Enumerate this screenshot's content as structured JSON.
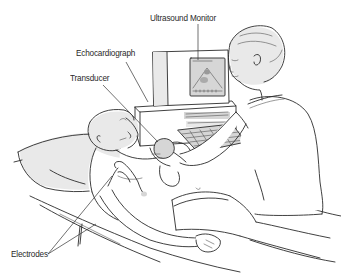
{
  "figure": {
    "labels": {
      "ultrasound_monitor": "Ultrasound Monitor",
      "echocardiograph": "Echocardiograph",
      "transducer": "Transducer",
      "electrodes": "Electrodes"
    },
    "colors": {
      "background": "#ffffff",
      "line": "#2b2b2b",
      "label_text": "#2a2a2a",
      "shading": "#e0e0e0"
    }
  }
}
